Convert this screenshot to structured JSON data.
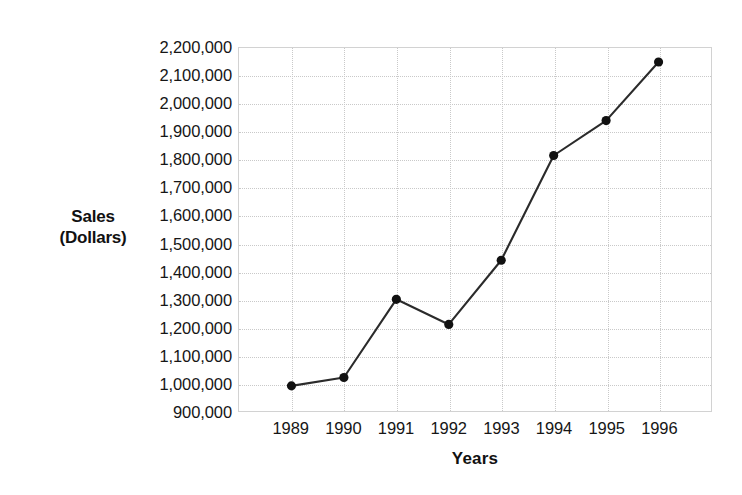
{
  "chart_data": {
    "type": "line",
    "title": "",
    "xlabel": "Years",
    "ylabel": "Sales\n(Dollars)",
    "ylabel_lines": [
      "Sales",
      "(Dollars)"
    ],
    "categories": [
      "1989",
      "1990",
      "1991",
      "1992",
      "1993",
      "1994",
      "1995",
      "1996"
    ],
    "values": [
      990000,
      1020000,
      1300000,
      1210000,
      1440000,
      1815000,
      1940000,
      2150000
    ],
    "series": [
      {
        "name": "Sales",
        "values": [
          990000,
          1020000,
          1300000,
          1210000,
          1440000,
          1815000,
          1940000,
          2150000
        ]
      }
    ],
    "ylim": [
      900000,
      2200000
    ],
    "ytick_step": 100000,
    "ytick_labels": [
      "2,200,000",
      "2,100,000",
      "2,000,000",
      "1,900,000",
      "1,800,000",
      "1,700,000",
      "1,600,000",
      "1,500,000",
      "1,400,000",
      "1,300,000",
      "1,200,000",
      "1,100,000",
      "1,000,000",
      "900,000"
    ],
    "ytick_values": [
      2200000,
      2100000,
      2000000,
      1900000,
      1800000,
      1700000,
      1600000,
      1500000,
      1400000,
      1300000,
      1200000,
      1100000,
      1000000,
      900000
    ],
    "xtick_labels": [
      "1989",
      "1990",
      "1991",
      "1992",
      "1993",
      "1994",
      "1995",
      "1996"
    ],
    "grid": true,
    "legend": false,
    "legend_position": "none",
    "marker": "circle",
    "colors": {
      "line": "#2b2b2b",
      "marker": "#111111",
      "grid": "#c9c9c9",
      "plot_border": "#d2d2d2",
      "background": "#ffffff",
      "text": "#161616"
    }
  }
}
